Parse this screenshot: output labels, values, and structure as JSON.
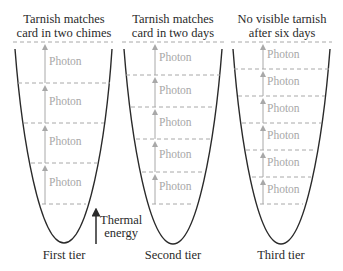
{
  "colors": {
    "well_stroke": "#2a2a2a",
    "dash": "#a8a8a8",
    "photon_arrow": "#a8a8a8",
    "photon_text": "#a8a8a8",
    "text": "#2a2a2a",
    "thermal_arrow": "#2a2a2a"
  },
  "wells": [
    {
      "title_line1": "Tarnish matches",
      "title_line2": "card in two chimes",
      "tier_label": "First tier",
      "photon_count": 4,
      "photon_label": "Photon"
    },
    {
      "title_line1": "Tarnish matches",
      "title_line2": "card in two days",
      "tier_label": "Second tier",
      "photon_count": 5,
      "photon_label": "Photon"
    },
    {
      "title_line1": "No visible tarnish",
      "title_line2": "after six days",
      "tier_label": "Third tier",
      "photon_count": 6,
      "photon_label": "Photon"
    }
  ],
  "thermal": {
    "line1": "Thermal",
    "line2": "energy"
  }
}
